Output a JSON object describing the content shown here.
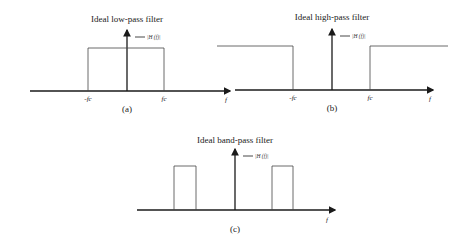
{
  "panels": [
    {
      "id": "a",
      "title": "Ideal low-pass filter",
      "legend": "|H (f)|",
      "ticks": [
        "-fc",
        "fc"
      ],
      "x_label": "f",
      "caption": "(a)"
    },
    {
      "id": "b",
      "title": "Ideal high-pass filter",
      "legend": "|H (f)|",
      "ticks": [
        "-fc",
        "fc"
      ],
      "x_label": "f",
      "caption": "(b)"
    },
    {
      "id": "c",
      "title": "Ideal band-pass filter",
      "legend": "|H (f)|",
      "ticks": [],
      "x_label": "f",
      "caption": "(c)"
    }
  ],
  "colors": {
    "line": "#1a1a1a",
    "box": "#444444"
  }
}
